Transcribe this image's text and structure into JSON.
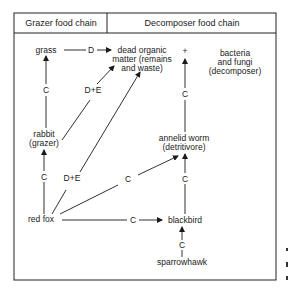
{
  "header": {
    "grazer": "Grazer food chain",
    "decomposer": "Decomposer food chain"
  },
  "nodes": {
    "grass": [
      "grass"
    ],
    "dom": [
      "dead organic",
      "matter (remains",
      "and waste)"
    ],
    "bacteria": [
      "bacteria",
      "and fungi",
      "(decomposer)"
    ],
    "rabbit": [
      "rabbit",
      "(grazer)"
    ],
    "worm": [
      "annelid worm",
      "(detritivore)"
    ],
    "fox": [
      "red fox"
    ],
    "blackbird": [
      "blackbird"
    ],
    "hawk": [
      "sparrowhawk"
    ]
  },
  "edges": {
    "grass_dom": "D",
    "rabbit_grass": "C",
    "rabbit_dom": "D+E",
    "fox_rabbit": "C",
    "fox_dom": "D+E",
    "fox_worm": "C",
    "fox_blackbird": "C",
    "worm_bact": "C",
    "blackbird_worm": "C",
    "hawk_blackbird": "C",
    "plus": "+"
  }
}
